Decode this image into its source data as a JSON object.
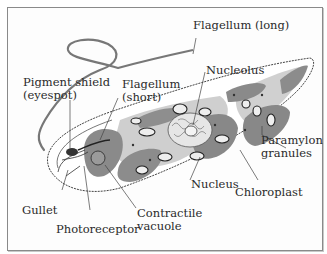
{
  "diagram": {
    "labels": {
      "flagellum_long": "Flagellum (long)",
      "pigment_shield_line1": "Pigment shield",
      "pigment_shield_line2": "(eyespot)",
      "flagellum_short_line1": "Flagellum",
      "flagellum_short_line2": "(short)",
      "nucleolus": "Nucleolus",
      "paramylon_line1": "Paramylon",
      "paramylon_line2": "granules",
      "nucleus": "Nucleus",
      "chloroplast": "Chloroplast",
      "gullet": "Gullet",
      "photoreceptor": "Photoreceptor",
      "contractile_line1": "Contractile",
      "contractile_line2": "vacuole"
    },
    "colors": {
      "chloroplast": "#8c8c8c",
      "cytoplasm_light": "#c9c9c9",
      "granule": "#e8e8e8",
      "outline": "#3a3a3a",
      "frame": "#8a8a8a"
    }
  }
}
